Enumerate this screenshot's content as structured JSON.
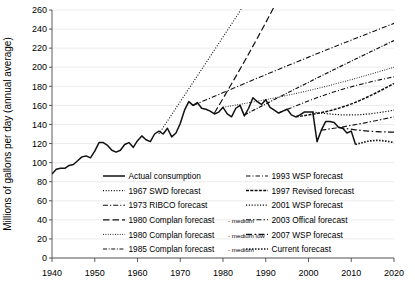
{
  "chart_data": {
    "type": "line",
    "title": "",
    "xlabel": "",
    "ylabel": "Millions of gallons per day (annual average)",
    "xlim": [
      1940,
      2020
    ],
    "ylim": [
      0,
      260
    ],
    "ytick_step": 20,
    "xtick_step": 10,
    "grid": true,
    "legend_position": "inside-bottom",
    "xticks": [
      "1940",
      "1950",
      "1960",
      "1970",
      "1980",
      "1990",
      "2000",
      "2010",
      "2020"
    ],
    "yticks": [
      "0",
      "20",
      "40",
      "60",
      "80",
      "100",
      "120",
      "140",
      "160",
      "180",
      "200",
      "220",
      "240",
      "260"
    ],
    "series": [
      {
        "name": "Actual consumption",
        "style": "solid",
        "x": [
          1940,
          1941,
          1942,
          1943,
          1944,
          1945,
          1946,
          1947,
          1948,
          1949,
          1950,
          1951,
          1952,
          1953,
          1954,
          1955,
          1956,
          1957,
          1958,
          1959,
          1960,
          1961,
          1962,
          1963,
          1964,
          1965,
          1966,
          1967,
          1968,
          1969,
          1970,
          1971,
          1972,
          1973,
          1974,
          1975,
          1976,
          1977,
          1978,
          1979,
          1980,
          1981,
          1982,
          1983,
          1984,
          1985,
          1986,
          1987,
          1988,
          1989,
          1990,
          1991,
          1992,
          1993,
          1994,
          1995,
          1996,
          1997,
          1998,
          1999,
          2000,
          2001,
          2002,
          2003,
          2004,
          2005,
          2006,
          2007,
          2008,
          2009,
          2010,
          2011
        ],
        "values": [
          88,
          93,
          94,
          94,
          97,
          98,
          102,
          106,
          107,
          105,
          112,
          121,
          121,
          118,
          113,
          111,
          113,
          119,
          121,
          116,
          123,
          128,
          124,
          122,
          130,
          133,
          130,
          136,
          127,
          131,
          141,
          155,
          164,
          160,
          163,
          157,
          156,
          154,
          151,
          153,
          158,
          151,
          148,
          157,
          160,
          149,
          157,
          168,
          164,
          161,
          166,
          158,
          155,
          152,
          154,
          156,
          150,
          148,
          150,
          153,
          153,
          153,
          122,
          134,
          143,
          143,
          142,
          137,
          136,
          131,
          133,
          119
        ],
        "ylim": [
          0,
          260
        ]
      },
      {
        "name": "1967 SWD forecast",
        "style": "dotted",
        "x": [
          1965,
          1990
        ],
        "values": [
          130,
          300
        ]
      },
      {
        "name": "1973 RIBCO forecast",
        "style": "dash-dot",
        "x": [
          1973,
          2020
        ],
        "values": [
          160,
          246
        ]
      },
      {
        "name": "1980 Complan forecast - medium",
        "style": "long-dash",
        "x": [
          1978,
          1996
        ],
        "values": [
          152,
          298
        ]
      },
      {
        "name": "1980 Complan forecast - medium low",
        "style": "fine-dotted",
        "x": [
          1980,
          2020
        ],
        "values": [
          158,
          200
        ]
      },
      {
        "name": "1985 Complan forecast - medium",
        "style": "dash-dot-dot",
        "x": [
          1985,
          2020
        ],
        "values": [
          150,
          228
        ]
      },
      {
        "name": "1993 WSP forecast",
        "style": "dash-dot-sparse",
        "x": [
          1993,
          2020
        ],
        "values": [
          152,
          190
        ]
      },
      {
        "name": "1997 Revised forecast",
        "style": "dense-dash",
        "x": [
          1997,
          2020
        ],
        "values": [
          148,
          183
        ]
      },
      {
        "name": "2001 WSP forecast",
        "style": "dotted-medium",
        "x": [
          2001,
          2020
        ],
        "values": [
          153,
          155
        ]
      },
      {
        "name": "2003 Offical forecast",
        "style": "dash-dot-long",
        "x": [
          2003,
          2020
        ],
        "values": [
          134,
          148
        ]
      },
      {
        "name": "2007 WSP forecast",
        "style": "dash-dot-wide",
        "x": [
          2007,
          2020
        ],
        "values": [
          137,
          132
        ]
      },
      {
        "name": "Current forecast",
        "style": "dotted-heavy",
        "x": [
          2011,
          2020
        ],
        "values": [
          119,
          121
        ]
      }
    ]
  },
  "legend": {
    "left_column": [
      {
        "label": "Actual consumption",
        "suffix": "",
        "style": "solid"
      },
      {
        "label": "1967 SWD forecast",
        "suffix": "",
        "style": "dotted"
      },
      {
        "label": "1973 RIBCO forecast",
        "suffix": "",
        "style": "dash-dot"
      },
      {
        "label": "1980 Complan forecast",
        "suffix": "- medium",
        "style": "long-dash"
      },
      {
        "label": "1980 Complan forecast",
        "suffix": "- medium low",
        "style": "fine-dotted"
      },
      {
        "label": "1985 Complan forecast",
        "suffix": "- medium",
        "style": "dash-dot-dot"
      }
    ],
    "right_column": [
      {
        "label": "1993 WSP forecast",
        "suffix": "",
        "style": "dash-dot-sparse"
      },
      {
        "label": "1997 Revised forecast",
        "suffix": "",
        "style": "dense-dash"
      },
      {
        "label": "2001 WSP forecast",
        "suffix": "",
        "style": "dotted-medium"
      },
      {
        "label": "2003 Offical forecast",
        "suffix": "",
        "style": "dash-dot-long"
      },
      {
        "label": "2007 WSP forecast",
        "suffix": "",
        "style": "dash-dot-wide"
      },
      {
        "label": "Current forecast",
        "suffix": "",
        "style": "dotted-heavy"
      }
    ]
  },
  "colors": {
    "line": "#111111",
    "grid": "#e3e3e3",
    "axis": "#4a4a4a",
    "background": "#ffffff"
  }
}
